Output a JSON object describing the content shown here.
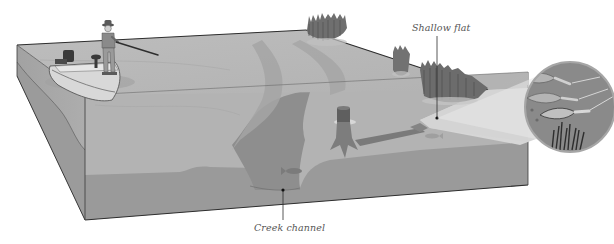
{
  "diagram": {
    "type": "cross-section illustration",
    "labels": {
      "shallow_flat": "Shallow flat",
      "creek_channel": "Creek channel"
    },
    "callouts": [
      {
        "id": "shallow-flat",
        "text": "Shallow flat",
        "points_to": "edge of shallow flat near weed line"
      },
      {
        "id": "creek-channel",
        "text": "Creek channel",
        "points_to": "submerged creek channel bottom"
      }
    ],
    "elements": [
      "angler-standing-in-boat",
      "fishing-rod",
      "bass-boat-with-outboard-and-trolling-motor",
      "water-surface-top-face",
      "creek-channel-path",
      "tree-stump",
      "submerged-log",
      "fish-in-channel",
      "weed-bed-clumps",
      "shallow-flat-light-area",
      "magnified-inset-with-three-lures-and-weeds"
    ],
    "inset": {
      "lure_count": 3,
      "content": "three crankbait lures running over weed tops"
    },
    "colors": {
      "background": "#ffffff",
      "water_top": "#b9b9b9",
      "water_front": "#b3b3b3",
      "bottom_front": "#9a9a9a",
      "left_face_top": "#a8a8a8",
      "left_face_bottom": "#9d9d9d",
      "channel": "#8e8e8e",
      "shallow_flat": "#d6d6d6",
      "weeds": "#6f6f6f",
      "inset_fill": "#8a8a8a",
      "outline": "#3a3a3a",
      "label_text": "#555555"
    }
  }
}
